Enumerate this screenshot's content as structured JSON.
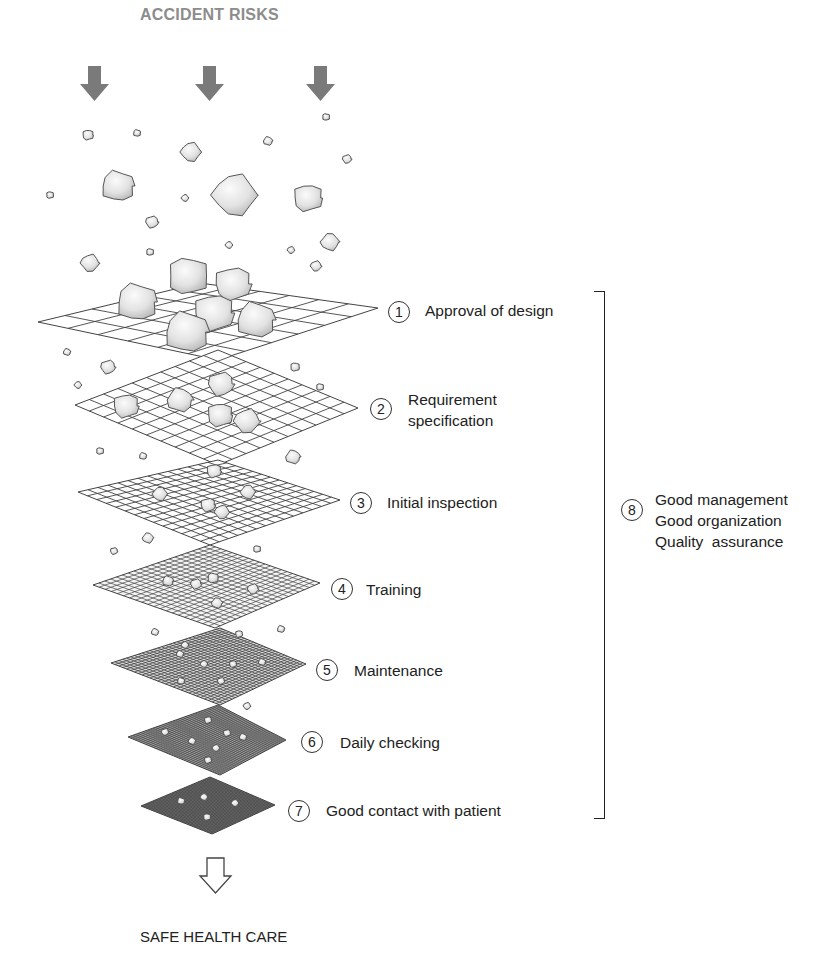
{
  "diagram": {
    "title_top": "ACCIDENT RISKS",
    "title_bottom": "SAFE HEALTH CARE",
    "colors": {
      "arrow_fill": "#7a7a7a",
      "grid_line": "#444444",
      "rock_fill": "#e4e4e4",
      "rock_stroke": "#555555",
      "text": "#222222",
      "title_top": "#8c8c8c"
    },
    "layers": [
      {
        "number": "1",
        "label": "Approval of design",
        "grid_divisions": 6
      },
      {
        "number": "2",
        "label": "Requirement\nspecification",
        "label_line1": "Requirement",
        "label_line2": "specification",
        "grid_divisions": 10
      },
      {
        "number": "3",
        "label": "Initial inspection",
        "grid_divisions": 14
      },
      {
        "number": "4",
        "label": "Training",
        "grid_divisions": 20
      },
      {
        "number": "5",
        "label": "Maintenance",
        "grid_divisions": 28
      },
      {
        "number": "6",
        "label": "Daily checking",
        "grid_divisions": 36
      },
      {
        "number": "7",
        "label": "Good contact with patient",
        "grid_divisions": 40
      }
    ],
    "bracket_group": {
      "number": "8",
      "lines": [
        "Good management",
        "Good organization",
        "Quality  assurance"
      ]
    },
    "icons": {
      "top_arrows": "down-arrow-filled-icon",
      "bottom_arrow": "down-arrow-outline-icon"
    }
  }
}
